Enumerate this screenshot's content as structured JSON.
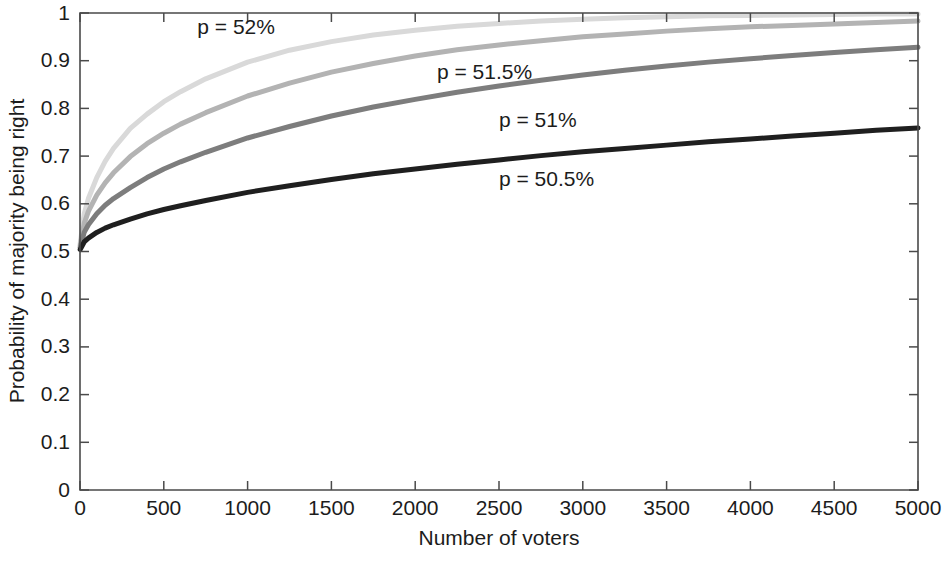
{
  "chart_data": {
    "type": "line",
    "title": "",
    "xlabel": "Number of voters",
    "ylabel": "Probability of majority being right",
    "xlim": [
      0,
      5000
    ],
    "ylim": [
      0,
      1
    ],
    "grid": false,
    "legend_position": "inline-annotations",
    "x_ticks": [
      0,
      500,
      1000,
      1500,
      2000,
      2500,
      3000,
      3500,
      4000,
      4500,
      5000
    ],
    "x_tick_labels": [
      "0",
      "500",
      "1000",
      "1500",
      "2000",
      "2500",
      "3000",
      "3500",
      "4000",
      "4500",
      "5000"
    ],
    "y_ticks": [
      0,
      0.1,
      0.2,
      0.3,
      0.4,
      0.5,
      0.6,
      0.7,
      0.8,
      0.9,
      1
    ],
    "y_tick_labels": [
      "0",
      "0.1",
      "0.2",
      "0.3",
      "0.4",
      "0.5",
      "0.6",
      "0.7",
      "0.8",
      "0.9",
      "1"
    ],
    "x": [
      1,
      25,
      50,
      100,
      150,
      200,
      300,
      400,
      500,
      600,
      750,
      1000,
      1250,
      1500,
      1750,
      2000,
      2250,
      2500,
      2750,
      3000,
      3250,
      3500,
      3750,
      4000,
      4250,
      4500,
      4750,
      5000
    ],
    "series": [
      {
        "name": "p = 52%",
        "p": 0.52,
        "color": "#d9d9d9",
        "stroke_width": 5.0,
        "label": "p = 52%",
        "label_x": 700,
        "label_y": 0.955,
        "values": [
          0.516,
          0.579,
          0.611,
          0.655,
          0.689,
          0.716,
          0.758,
          0.788,
          0.814,
          0.835,
          0.862,
          0.897,
          0.922,
          0.94,
          0.954,
          0.964,
          0.972,
          0.978,
          0.983,
          0.987,
          0.99,
          0.992,
          0.994,
          0.995,
          0.996,
          0.997,
          0.998,
          0.998
        ]
      },
      {
        "name": "p = 51.5%",
        "p": 0.515,
        "color": "#b3b3b3",
        "stroke_width": 5.0,
        "label": "p = 51.5%",
        "label_x": 2130,
        "label_y": 0.862,
        "values": [
          0.512,
          0.559,
          0.584,
          0.618,
          0.644,
          0.665,
          0.699,
          0.726,
          0.748,
          0.767,
          0.791,
          0.826,
          0.853,
          0.876,
          0.894,
          0.91,
          0.923,
          0.933,
          0.942,
          0.95,
          0.956,
          0.962,
          0.967,
          0.971,
          0.974,
          0.977,
          0.98,
          0.983
        ]
      },
      {
        "name": "p = 51%",
        "p": 0.51,
        "color": "#7d7d7d",
        "stroke_width": 5.0,
        "label": "p = 51%",
        "label_x": 2500,
        "label_y": 0.762,
        "values": [
          0.508,
          0.54,
          0.556,
          0.579,
          0.597,
          0.611,
          0.634,
          0.655,
          0.673,
          0.688,
          0.708,
          0.738,
          0.762,
          0.784,
          0.803,
          0.819,
          0.834,
          0.847,
          0.859,
          0.87,
          0.88,
          0.889,
          0.897,
          0.904,
          0.911,
          0.917,
          0.923,
          0.928
        ]
      },
      {
        "name": "p = 50.5%",
        "p": 0.505,
        "color": "#1f1f1f",
        "stroke_width": 5.0,
        "label": "p = 50.5%",
        "label_x": 2500,
        "label_y": 0.638,
        "values": [
          0.504,
          0.52,
          0.528,
          0.54,
          0.549,
          0.556,
          0.568,
          0.579,
          0.588,
          0.596,
          0.607,
          0.624,
          0.638,
          0.651,
          0.663,
          0.673,
          0.683,
          0.692,
          0.701,
          0.709,
          0.716,
          0.723,
          0.73,
          0.736,
          0.742,
          0.748,
          0.754,
          0.759
        ]
      }
    ]
  },
  "axes": {
    "x_title": "Number of voters",
    "y_title": "Probability of majority being right"
  },
  "colors": {
    "axis": "#4a4a4a",
    "text": "#1c1c1c",
    "background": "#ffffff"
  }
}
